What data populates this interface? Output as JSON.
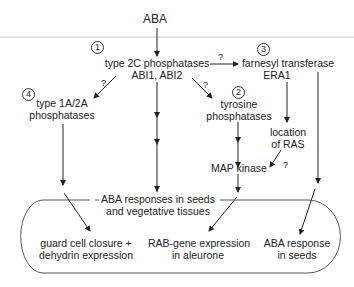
{
  "diagram": {
    "root": "ABA",
    "nodes": {
      "pp2c": {
        "number": "1",
        "line1": "type 2C phosphatases",
        "line2": "ABI1, ABI2"
      },
      "tyrosine": {
        "number": "2",
        "line1": "tyrosine",
        "line2": "phosphatases"
      },
      "farnesyl": {
        "number": "3",
        "line1": "farnesyl transferase",
        "line2": "ERA1"
      },
      "pp1a2a": {
        "number": "4",
        "line1": "type 1A/2A",
        "line2": "phosphatases"
      },
      "ras": {
        "line1": "location",
        "line2": "of RAS"
      },
      "mapk": {
        "line1": "MAP kinase"
      },
      "aba_responses": {
        "line1": "ABA responses in seeds",
        "line2": "and vegetative tissues"
      },
      "guard_cell": {
        "line1": "guard cell closure +",
        "line2": "dehydrin expression"
      },
      "rab": {
        "line1": "RAB-gene expression",
        "line2": "in aleurone"
      },
      "seed_response": {
        "line1": "ABA response",
        "line2": "in seeds"
      }
    },
    "uncertain_mark": "?",
    "edges": [
      {
        "from": "ABA",
        "to": "pp2c"
      },
      {
        "from": "pp2c",
        "to": "farnesyl",
        "uncertain": true
      },
      {
        "from": "pp2c",
        "to": "pp1a2a",
        "uncertain": true
      },
      {
        "from": "pp2c",
        "to": "tyrosine",
        "uncertain": true
      },
      {
        "from": "pp2c",
        "to": "aba_responses"
      },
      {
        "from": "farnesyl",
        "to": "ras"
      },
      {
        "from": "ras",
        "to": "mapk",
        "uncertain": true
      },
      {
        "from": "tyrosine",
        "to": "mapk"
      },
      {
        "from": "mapk",
        "to": "rab"
      },
      {
        "from": "pp1a2a",
        "to": "guard_cell"
      },
      {
        "from": "farnesyl",
        "to": "seed_response"
      }
    ]
  }
}
